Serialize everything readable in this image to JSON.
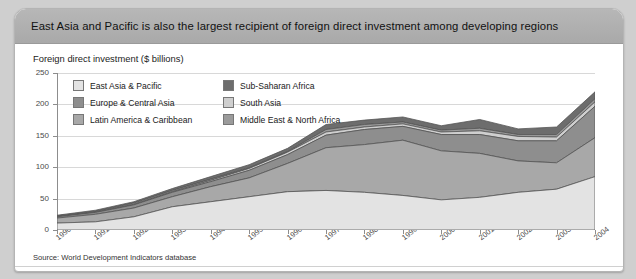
{
  "header": {
    "title": "East Asia and Pacific is also the largest recipient of foreign direct investment among developing regions"
  },
  "subtitle": "Foreign direct investment ($ billions)",
  "source": "Source: World Development Indicators database",
  "colors": {
    "east_asia_pacific": "#e3e3e3",
    "latin_america_caribbean": "#a8a8a8",
    "europe_central_asia": "#8e8e8e",
    "south_asia": "#cfcfcf",
    "middle_east_north_africa": "#9b9b9b",
    "sub_saharan_africa": "#6d6d6d",
    "outline": "#555555",
    "header_bar": "#b0b0b0",
    "grid": "#d8d8d8",
    "axis": "#8d8d8d"
  },
  "chart_data": {
    "type": "area",
    "stacked": true,
    "title": "Foreign direct investment ($ billions)",
    "xlabel": "",
    "ylabel": "",
    "ylim": [
      0,
      250
    ],
    "yticks": [
      0,
      50,
      100,
      150,
      200,
      250
    ],
    "grid": true,
    "legend_position": "top-left-inside",
    "categories": [
      "1990",
      "1991",
      "1992",
      "1993",
      "1994",
      "1995",
      "1996",
      "1997",
      "1998",
      "1999",
      "2000",
      "2001",
      "2002",
      "2003",
      "2004"
    ],
    "series": [
      {
        "name": "East Asia & Pacific",
        "values": [
          11,
          13,
          21,
          37,
          45,
          53,
          61,
          63,
          60,
          55,
          48,
          52,
          60,
          65,
          85
        ]
      },
      {
        "name": "Latin America & Caribbean",
        "values": [
          8,
          12,
          14,
          16,
          24,
          30,
          45,
          68,
          76,
          88,
          78,
          70,
          50,
          42,
          62
        ]
      },
      {
        "name": "Europe & Central Asia",
        "values": [
          2,
          3,
          5,
          7,
          8,
          12,
          14,
          20,
          24,
          22,
          26,
          30,
          32,
          35,
          50
        ]
      },
      {
        "name": "South Asia",
        "values": [
          0.5,
          0.5,
          1,
          1,
          2,
          3,
          4,
          5,
          4,
          4,
          4,
          6,
          7,
          6,
          7
        ]
      },
      {
        "name": "Middle East & North Africa",
        "values": [
          1,
          1,
          2,
          2,
          2,
          1,
          1,
          4,
          4,
          3,
          3,
          4,
          3,
          4,
          5
        ]
      },
      {
        "name": "Sub-Saharan Africa",
        "values": [
          1,
          2,
          2,
          3,
          4,
          5,
          5,
          8,
          7,
          8,
          7,
          14,
          9,
          12,
          11
        ]
      }
    ],
    "totals": [
      23.5,
      31.5,
      45,
      66,
      85,
      104,
      130,
      168,
      175,
      180,
      166,
      176,
      161,
      164,
      220
    ]
  },
  "legend": {
    "items": [
      {
        "label": "East Asia & Pacific",
        "color": "#e3e3e3"
      },
      {
        "label": "Sub-Saharan Africa",
        "color": "#6d6d6d"
      },
      {
        "label": "Europe & Central Asia",
        "color": "#8e8e8e"
      },
      {
        "label": "South Asia",
        "color": "#cfcfcf"
      },
      {
        "label": "Latin America & Caribbean",
        "color": "#a8a8a8"
      },
      {
        "label": "Middle East & North Africa",
        "color": "#9b9b9b"
      }
    ]
  }
}
